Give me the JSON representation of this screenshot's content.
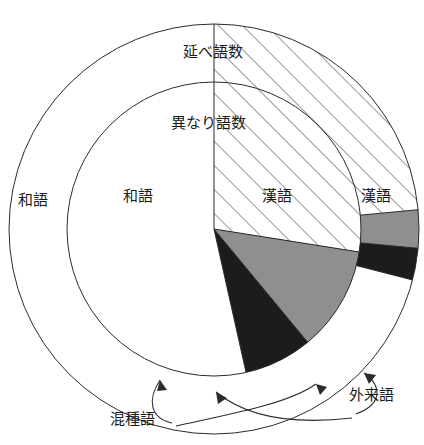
{
  "figure": {
    "title_outer": "延べ語数",
    "title_inner": "異なり語数",
    "callout_konshugo": "混種語",
    "callout_gairaigo": "外来語",
    "label_wago_outer": "和語",
    "label_wago_inner": "和語",
    "label_kango_inner": "漢語",
    "label_kango_outer": "漢語"
  },
  "colors": {
    "line": "#2b2b2b",
    "wago_fill": "#ffffff",
    "kango_fill": "#ffffff",
    "kango_hatch": "#4a4a4a",
    "gairaigo_fill": "#8f8f8f",
    "konshugo_fill": "#1c1c1c",
    "text": "#1a1a1a"
  },
  "geometry": {
    "cx": 214,
    "cy": 229,
    "r_outer": 205,
    "r_inner": 147
  },
  "chart_data": {
    "type": "pie",
    "legend": "none",
    "grid": false,
    "rings": [
      {
        "name": "延べ語数",
        "ring": "outer",
        "categories": [
          "和語",
          "漢語",
          "外来語",
          "混種語"
        ],
        "values": [
          71.0,
          23.5,
          3.0,
          2.5
        ],
        "unit": "%",
        "start_angle_deg": 0,
        "direction": "clockwise-for-kango",
        "styles": [
          "white",
          "diagonal-hatch",
          "gray",
          "black"
        ]
      },
      {
        "name": "異なり語数",
        "ring": "inner",
        "categories": [
          "和語",
          "漢語",
          "外来語",
          "混種語"
        ],
        "values": [
          53.5,
          27.5,
          11.5,
          7.5
        ],
        "unit": "%",
        "start_angle_deg": 0,
        "direction": "clockwise-for-kango",
        "styles": [
          "white",
          "diagonal-hatch",
          "gray",
          "black"
        ]
      }
    ],
    "xlabel": "",
    "ylabel": ""
  },
  "labels": [
    {
      "id": "outer-title",
      "text": "延べ語数",
      "x": 213,
      "y": 57
    },
    {
      "id": "inner-title",
      "text": "異なり語数",
      "x": 208,
      "y": 128
    },
    {
      "id": "wago-outer",
      "text": "和語",
      "x": 33,
      "y": 205
    },
    {
      "id": "wago-inner",
      "text": "和語",
      "x": 138,
      "y": 201
    },
    {
      "id": "kango-inner",
      "text": "漢語",
      "x": 277,
      "y": 201
    },
    {
      "id": "kango-outer",
      "text": "漢語",
      "x": 376,
      "y": 201
    },
    {
      "id": "konshugo",
      "text": "混種語",
      "x": 132,
      "y": 424
    },
    {
      "id": "gairaigo",
      "text": "外来語",
      "x": 371,
      "y": 400
    }
  ]
}
